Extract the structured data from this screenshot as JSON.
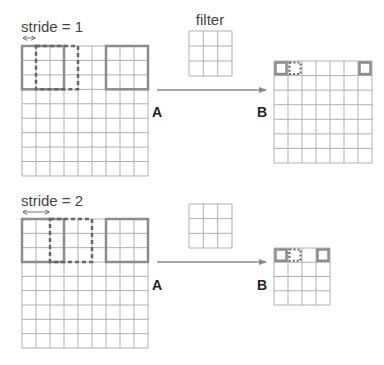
{
  "colors": {
    "grid": "#b0b0b0",
    "solid_box": "#8c8c8c",
    "dash_box": "#666666",
    "arrow": "#8c8c8c",
    "text": "#444444"
  },
  "panels": [
    {
      "stride_label": "stride = 1",
      "stride": 1,
      "filter_label": "filter",
      "input_label": "A",
      "output_label": "B",
      "input": {
        "x": 22,
        "y": 46,
        "rows": 9,
        "cols": 9,
        "cell_w": 14,
        "cell_h": 14.44
      },
      "filter": {
        "x": 189,
        "y": 31,
        "rows": 3,
        "cols": 3,
        "cell_w": 14.33,
        "cell_h": 15
      },
      "output": {
        "x": 274,
        "y": 61,
        "rows": 7,
        "cols": 7,
        "cell_w": 14,
        "cell_h": 14.57
      },
      "stride_arrow": {
        "x1": 22,
        "x2": 36,
        "y": 38
      },
      "arrow": {
        "x1": 157,
        "x2": 266,
        "y": 90
      },
      "input_label_pos": {
        "x": 152,
        "y": 117
      },
      "output_label_pos": {
        "x": 257,
        "y": 117
      },
      "stride_label_pos": {
        "x": 21,
        "y": 32
      },
      "filter_label_pos": {
        "x": 210,
        "y": 25
      },
      "input_solid_boxes": [
        {
          "col": 0,
          "row": 0,
          "size": 3
        },
        {
          "col": 6,
          "row": 0,
          "size": 3
        }
      ],
      "input_dashed_boxes": [
        {
          "col": 1,
          "row": 0,
          "size": 3
        }
      ],
      "output_solid_cells": [
        {
          "col": 0,
          "row": 0
        },
        {
          "col": 6,
          "row": 0
        }
      ],
      "output_dashed_cells": [
        {
          "col": 1,
          "row": 0
        }
      ]
    },
    {
      "stride_label": "stride = 2",
      "stride": 2,
      "filter_label": "",
      "input_label": "A",
      "output_label": "B",
      "input": {
        "x": 22,
        "y": 219,
        "rows": 9,
        "cols": 9,
        "cell_w": 14,
        "cell_h": 14.33
      },
      "filter": {
        "x": 189,
        "y": 204,
        "rows": 3,
        "cols": 3,
        "cell_w": 14.33,
        "cell_h": 14.67
      },
      "output": {
        "x": 274,
        "y": 248,
        "rows": 4,
        "cols": 4,
        "cell_w": 14,
        "cell_h": 14.25
      },
      "stride_arrow": {
        "x1": 22,
        "x2": 50,
        "y": 212
      },
      "arrow": {
        "x1": 157,
        "x2": 266,
        "y": 262
      },
      "input_label_pos": {
        "x": 152,
        "y": 290
      },
      "output_label_pos": {
        "x": 257,
        "y": 290
      },
      "stride_label_pos": {
        "x": 21,
        "y": 206
      },
      "filter_label_pos": {
        "x": 210,
        "y": 198
      },
      "input_solid_boxes": [
        {
          "col": 0,
          "row": 0,
          "size": 3
        },
        {
          "col": 6,
          "row": 0,
          "size": 3
        }
      ],
      "input_dashed_boxes": [
        {
          "col": 2,
          "row": 0,
          "size": 3
        }
      ],
      "output_solid_cells": [
        {
          "col": 0,
          "row": 0
        },
        {
          "col": 3,
          "row": 0
        }
      ],
      "output_dashed_cells": [
        {
          "col": 1,
          "row": 0
        }
      ]
    }
  ]
}
